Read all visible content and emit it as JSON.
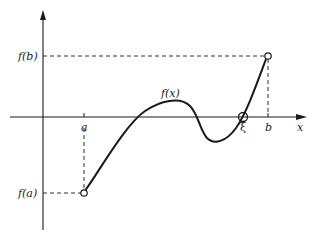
{
  "diagram": {
    "type": "intermediate-value-theorem-illustration",
    "colors": {
      "ink": "#1a1a1a",
      "background": "#ffffff"
    },
    "axes": {
      "x_label": "x",
      "x_ticks": [
        {
          "label": "a",
          "x": 84
        },
        {
          "label": "ξ",
          "x": 243
        },
        {
          "label": "b",
          "x": 268
        }
      ],
      "y_ticks": [
        {
          "label": "f(b)",
          "y": 56
        },
        {
          "label": "f(a)",
          "y": 193
        }
      ]
    },
    "curve": {
      "label": "f(x)",
      "endpoints": [
        {
          "name": "f(a) point",
          "x": 84,
          "y": 193
        },
        {
          "name": "f(b) point",
          "x": 268,
          "y": 56
        }
      ],
      "root_marker": {
        "label": "ξ",
        "x": 243,
        "y": 117
      }
    }
  }
}
